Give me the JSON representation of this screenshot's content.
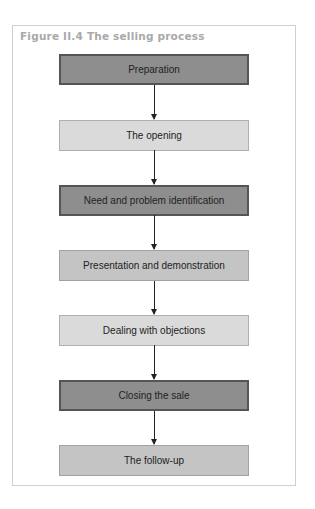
{
  "figure": {
    "label": "Figure II.4",
    "title": "Figure II.4  The selling process"
  },
  "steps": [
    {
      "label": "Preparation",
      "shade": "dark"
    },
    {
      "label": "The opening",
      "shade": "light"
    },
    {
      "label": "Need and problem identification",
      "shade": "dark"
    },
    {
      "label": "Presentation and demonstration",
      "shade": "mid"
    },
    {
      "label": "Dealing with objections",
      "shade": "light"
    },
    {
      "label": "Closing the sale",
      "shade": "dark"
    },
    {
      "label": "The follow-up",
      "shade": "mid"
    }
  ],
  "colors": {
    "dark_fill": "#8e8e8e",
    "light_fill": "#dadada",
    "mid_fill": "#c4c4c4",
    "title": "#a9a9a9"
  }
}
